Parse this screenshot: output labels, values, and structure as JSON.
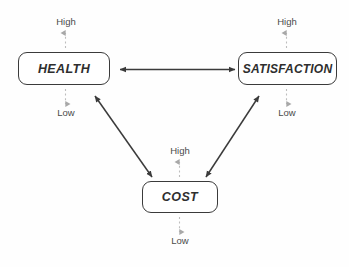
{
  "diagram": {
    "background_color": "#fefefe",
    "line_color": "#3b3b3b",
    "dashed_line_color": "#b9b9b9",
    "text_color": "#2e2e2e",
    "nodes": [
      {
        "id": "health",
        "label": "HEALTH",
        "high_label": "High",
        "low_label": "Low"
      },
      {
        "id": "satisfaction",
        "label": "SATISFACTION",
        "high_label": "High",
        "low_label": "Low"
      },
      {
        "id": "cost",
        "label": "COST",
        "high_label": "High",
        "low_label": "Low"
      }
    ],
    "connections": [
      {
        "from": "health",
        "to": "satisfaction",
        "style": "double-headed-arrow"
      },
      {
        "from": "health",
        "to": "cost",
        "style": "double-headed-arrow"
      },
      {
        "from": "satisfaction",
        "to": "cost",
        "style": "double-headed-arrow"
      }
    ],
    "scales": {
      "health_high": "High",
      "health_low": "Low",
      "satisfaction_high": "High",
      "satisfaction_low": "Low",
      "cost_high": "High",
      "cost_low": "Low"
    }
  }
}
